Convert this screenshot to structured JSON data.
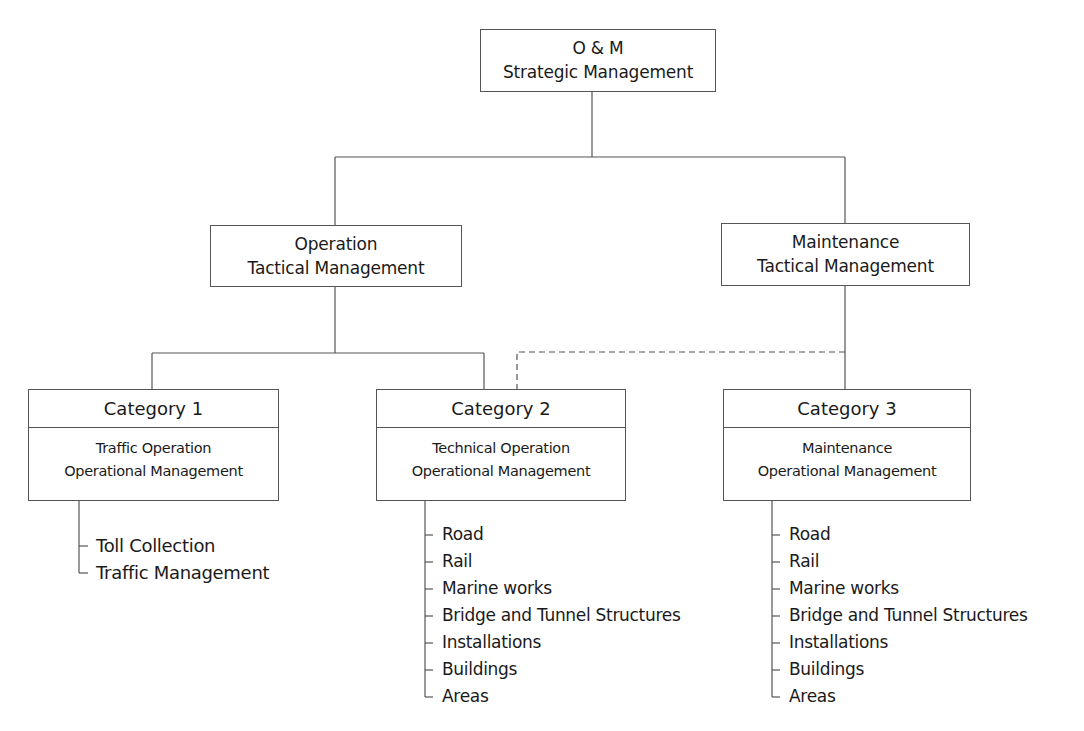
{
  "diagram": {
    "type": "organizational hierarchy",
    "line_color": "#555555",
    "root": {
      "line1": "O & M",
      "line2": "Strategic Management"
    },
    "tactical": [
      {
        "line1": "Operation",
        "line2": "Tactical Management"
      },
      {
        "line1": "Maintenance",
        "line2": "Tactical Management"
      }
    ],
    "categories": [
      {
        "title": "Category 1",
        "line1": "Traffic Operation",
        "line2": "Operational Management",
        "parent": "Operation Tactical Management",
        "items": [
          "Toll Collection",
          "Traffic Management"
        ]
      },
      {
        "title": "Category 2",
        "line1": "Technical Operation",
        "line2": "Operational Management",
        "parent": "Operation Tactical Management",
        "secondary_parent_dashed": "Maintenance Tactical Management",
        "items": [
          "Road",
          "Rail",
          "Marine works",
          "Bridge and Tunnel Structures",
          "Installations",
          "Buildings",
          "Areas"
        ]
      },
      {
        "title": "Category 3",
        "line1": "Maintenance",
        "line2": "Operational Management",
        "parent": "Maintenance Tactical Management",
        "items": [
          "Road",
          "Rail",
          "Marine works",
          "Bridge and Tunnel Structures",
          "Installations",
          "Buildings",
          "Areas"
        ]
      }
    ]
  }
}
